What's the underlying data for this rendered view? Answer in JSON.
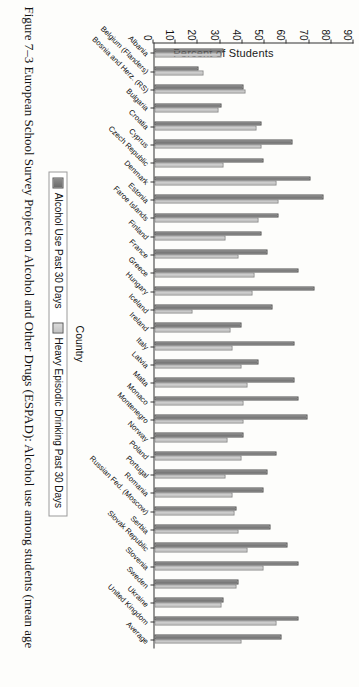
{
  "figure": {
    "caption": "Figure 7–3  European School Survey Project on Alcohol and Other Drugs (ESPAD): Alcohol use among students (mean age"
  },
  "legend": {
    "series1_label": "Alcohol Use Past 30 Days",
    "series2_label": "Heavy Episodic Drinking Past 30 Days",
    "series1_color": "#767676",
    "series2_color": "#cbcbcb"
  },
  "chart_data": {
    "type": "bar",
    "title": "",
    "xlabel": "Country",
    "ylabel": "Percent of Students",
    "ylim": [
      0,
      90
    ],
    "yticks": [
      0,
      10,
      20,
      30,
      40,
      50,
      60,
      70,
      80,
      90
    ],
    "grid": false,
    "legend_position": "bottom",
    "orientation": "vertical-grouped",
    "categories": [
      "Albania",
      "Belgium (Flanders)",
      "Bosnia and Herz. (RS)",
      "Bulgaria",
      "Croatia",
      "Cyprus",
      "Czech Republic",
      "Denmark",
      "Estonia",
      "Faroe Islands",
      "Finland",
      "France",
      "Greece",
      "Hungary",
      "Iceland",
      "Ireland",
      "Italy",
      "Latvia",
      "Malta",
      "Monaco",
      "Montenegro",
      "Norway",
      "Poland",
      "Portugal",
      "Romania",
      "Russian Fed. (Moscow)",
      "Serbia",
      "Slovak Republic",
      "Slovenia",
      "Sweden",
      "Ukraine",
      "United Kingdom",
      "Average"
    ],
    "series": [
      {
        "name": "Alcohol Use Past 30 Days",
        "values": [
          31,
          20,
          40,
          30,
          48,
          62,
          49,
          70,
          76,
          56,
          48,
          51,
          65,
          72,
          53,
          39,
          63,
          47,
          63,
          65,
          69,
          40,
          55,
          51,
          49,
          37,
          52,
          60,
          65,
          38,
          31,
          65,
          57
        ]
      },
      {
        "name": "Heavy Episodic Drinking Past 30 Days",
        "values": [
          30,
          22,
          41,
          29,
          46,
          48,
          31,
          55,
          56,
          47,
          32,
          38,
          45,
          44,
          17,
          34,
          35,
          39,
          42,
          40,
          40,
          33,
          39,
          32,
          35,
          36,
          38,
          42,
          49,
          37,
          30,
          55,
          39
        ]
      }
    ]
  }
}
